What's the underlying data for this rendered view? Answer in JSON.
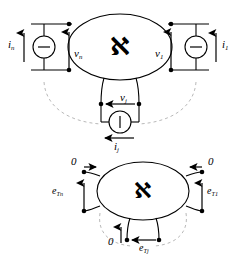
{
  "figure": {
    "colors": {
      "stroke": "#000000",
      "arc": "#b9b9b9",
      "background": "#ffffff"
    },
    "network_symbol": "ℵ"
  },
  "top_diagram": {
    "network_symbol": "ℵ",
    "ports": {
      "left": {
        "current_label": "i",
        "current_sub": "n",
        "voltage_label": "v",
        "voltage_sub": "n",
        "source_type": "horizontal-bar-source"
      },
      "right": {
        "current_label": "i",
        "current_sub": "1",
        "voltage_label": "v",
        "voltage_sub": "1",
        "source_type": "horizontal-bar-source"
      },
      "bottom": {
        "current_label": "i",
        "current_sub": "j",
        "voltage_label": "v",
        "voltage_sub": "j",
        "source_type": "vertical-bar-source"
      }
    }
  },
  "bottom_diagram": {
    "network_symbol": "ℵ",
    "ports": {
      "left": {
        "zero_label": "0",
        "emf_label": "e",
        "emf_sub": "Tn"
      },
      "right": {
        "zero_label": "0",
        "emf_label": "e",
        "emf_sub": "T1"
      },
      "bottom": {
        "zero_label": "0",
        "emf_label": "e",
        "emf_sub": "Tj"
      }
    }
  }
}
